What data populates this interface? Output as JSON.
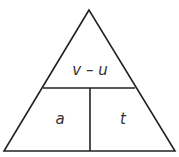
{
  "diagram": {
    "type": "formula-triangle",
    "top_label": "v – u",
    "bottom_left_label": "a",
    "bottom_right_label": "t",
    "line_color": "#222222"
  }
}
